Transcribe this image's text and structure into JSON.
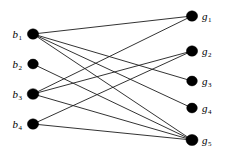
{
  "figure": {
    "width": 225,
    "height": 154,
    "background": "#ffffff",
    "node_color": "#000000",
    "edge_color": "#1c1c1c"
  },
  "chart_data": {
    "type": "diagram",
    "diagram_type": "bipartite-graph",
    "title": "",
    "xlabel": "",
    "ylabel": "",
    "grid": false,
    "legend": null,
    "left_set_name": "b",
    "right_set_name": "g",
    "nodes": {
      "left": [
        {
          "id": "b1",
          "base": "b",
          "sub": "1",
          "label": "b1",
          "x": 33,
          "y": 34,
          "r": 5.6
        },
        {
          "id": "b2",
          "base": "b",
          "sub": "2",
          "label": "b2",
          "x": 33,
          "y": 64,
          "r": 5.3
        },
        {
          "id": "b3",
          "base": "b",
          "sub": "3",
          "label": "b3",
          "x": 33,
          "y": 94,
          "r": 5.8
        },
        {
          "id": "b4",
          "base": "b",
          "sub": "4",
          "label": "b4",
          "x": 33,
          "y": 124,
          "r": 5.6
        }
      ],
      "right": [
        {
          "id": "g1",
          "base": "g",
          "sub": "1",
          "label": "g1",
          "x": 192,
          "y": 16,
          "r": 5.6
        },
        {
          "id": "g2",
          "base": "g",
          "sub": "2",
          "label": "g2",
          "x": 192,
          "y": 51,
          "r": 5.6
        },
        {
          "id": "g3",
          "base": "g",
          "sub": "3",
          "label": "g3",
          "x": 192,
          "y": 81,
          "r": 5.3
        },
        {
          "id": "g4",
          "base": "g",
          "sub": "4",
          "label": "g4",
          "x": 192,
          "y": 108,
          "r": 5.3
        },
        {
          "id": "g5",
          "base": "g",
          "sub": "5",
          "label": "g5",
          "x": 192,
          "y": 140,
          "r": 6.0
        }
      ]
    },
    "edges": [
      {
        "from": "b1",
        "to": "g1"
      },
      {
        "from": "b1",
        "to": "g3"
      },
      {
        "from": "b1",
        "to": "g4"
      },
      {
        "from": "b1",
        "to": "g5"
      },
      {
        "from": "b2",
        "to": "g5"
      },
      {
        "from": "b3",
        "to": "g1"
      },
      {
        "from": "b3",
        "to": "g2"
      },
      {
        "from": "b3",
        "to": "g5"
      },
      {
        "from": "b4",
        "to": "g2"
      },
      {
        "from": "b4",
        "to": "g5"
      }
    ],
    "edge_count": 10,
    "node_count": 9
  }
}
